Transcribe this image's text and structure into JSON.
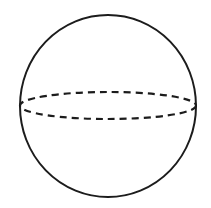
{
  "diagram": {
    "type": "sphere",
    "background": "#ffffff",
    "stroke_color": "#1c1c1c",
    "outline": {
      "cx": 108,
      "cy": 106,
      "rx": 88,
      "ry": 91,
      "stroke_width": 2
    },
    "equator": {
      "cx": 108,
      "cy": 105.5,
      "rx": 88,
      "ry": 13.5,
      "stroke_width": 2.2,
      "dash": "7,5",
      "style": "dashed"
    }
  }
}
